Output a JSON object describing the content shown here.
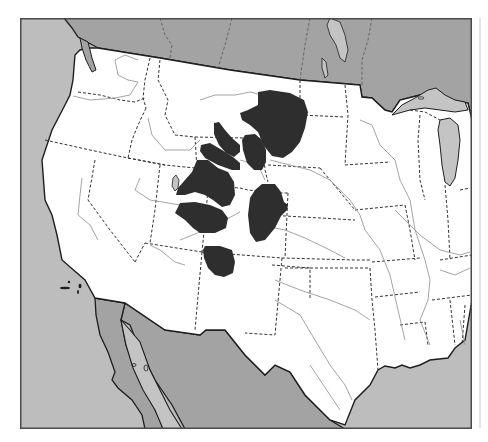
{
  "map": {
    "title": "Distribution range map, western United States",
    "colors": {
      "ocean": "#bdbdbd",
      "foreign_land": "#a3a3a3",
      "lakes": "#c4c4c4",
      "us_land": "#ffffff",
      "range": "#2e2e2e",
      "frame": "#4a4a4a",
      "coastline": "#1e1e1e",
      "state_border": "#333333",
      "river": "#9a9a9a"
    },
    "range_regions": [
      {
        "name": "montana-range",
        "label": "Range region 1"
      },
      {
        "name": "central-wyoming-range",
        "label": "Range region 2"
      },
      {
        "name": "wyoming-strip-north-range",
        "label": "Range region 3"
      },
      {
        "name": "wyoming-strip-south-range",
        "label": "Range region 4"
      },
      {
        "name": "northern-utah-range",
        "label": "Range region 5"
      },
      {
        "name": "colorado-range",
        "label": "Range region 6"
      },
      {
        "name": "central-utah-range",
        "label": "Range region 7"
      },
      {
        "name": "four-corners-range",
        "label": "Range region 8"
      }
    ]
  }
}
